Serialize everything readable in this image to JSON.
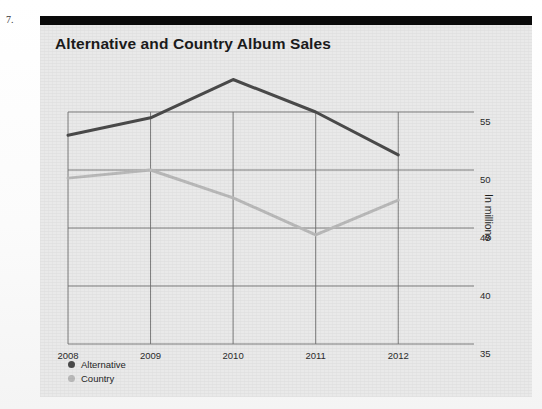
{
  "question_number": "7.",
  "panel": {
    "title": "Alternative and Country Album Sales"
  },
  "colors": {
    "alternative": "#4a4a4a",
    "country": "#b9b9b9",
    "grid": "#6f6f6f",
    "panel_background": "#e9e9e9",
    "header_bar": "#0b0b0b",
    "text": "#1b1b1b"
  },
  "chart_data": {
    "type": "line",
    "title": "Alternative and Country Album Sales",
    "xlabel": "",
    "ylabel": "In millions",
    "x": [
      "2008",
      "2009",
      "2010",
      "2011",
      "2012"
    ],
    "categories": [
      "2008",
      "2009",
      "2010",
      "2011",
      "2012"
    ],
    "xtick_labels": [
      "2008",
      "2009",
      "2010",
      "2011",
      "2012"
    ],
    "ytick_labels": [
      "35",
      "40",
      "45",
      "50",
      "55"
    ],
    "yticks": [
      35,
      40,
      45,
      50,
      55
    ],
    "ylim": [
      35,
      57
    ],
    "grid": true,
    "legend_position": "bottom-left",
    "series": [
      {
        "name": "Alternative",
        "color": "#4a4a4a",
        "values": [
          53.0,
          54.5,
          57.8,
          55.0,
          51.3
        ]
      },
      {
        "name": "Country",
        "color": "#b9b9b9",
        "values": [
          49.3,
          50.0,
          47.6,
          44.4,
          47.4
        ]
      }
    ]
  },
  "legend": {
    "items": [
      {
        "label": "Alternative",
        "color": "#4a4a4a"
      },
      {
        "label": "Country",
        "color": "#b9b9b9"
      }
    ]
  }
}
